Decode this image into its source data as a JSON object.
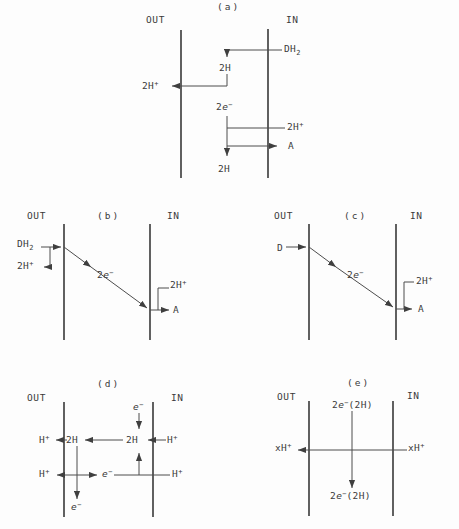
{
  "figure": {
    "background_color": "#fdfdfd",
    "ink_color": "#3a3a3a",
    "panels": {
      "a": {
        "title": "(a)",
        "out_label": "OUT",
        "in_label": "IN",
        "dh2": {
          "base": "DH",
          "sub": "2"
        },
        "h2_top": "2H",
        "h2plus_out": {
          "base": "2H",
          "sup": "+"
        },
        "two_e": {
          "coef": "2",
          "e": "e",
          "sup": "−"
        },
        "h2plus_in": {
          "base": "2H",
          "sup": "+"
        },
        "acceptor": "A",
        "h2_bottom": "2H"
      },
      "b": {
        "title": "(b)",
        "out_label": "OUT",
        "in_label": "IN",
        "dh2": {
          "base": "DH",
          "sub": "2"
        },
        "h2plus_out": {
          "base": "2H",
          "sup": "+"
        },
        "two_e": {
          "coef": "2",
          "e": "e",
          "sup": "−"
        },
        "h2plus_in": {
          "base": "2H",
          "sup": "+"
        },
        "acceptor": "A"
      },
      "c": {
        "title": "(c)",
        "out_label": "OUT",
        "in_label": "IN",
        "donor": "D",
        "two_e": {
          "coef": "2",
          "e": "e",
          "sup": "−"
        },
        "h2plus_in": {
          "base": "2H",
          "sup": "+"
        },
        "acceptor": "A"
      },
      "d": {
        "title": "(d)",
        "out_label": "OUT",
        "in_label": "IN",
        "e_top": {
          "e": "e",
          "sup": "−"
        },
        "h_out_top": {
          "base": "H",
          "sup": "+"
        },
        "h2_left": "2H",
        "h2_right": "2H",
        "h_in_top": {
          "base": "H",
          "sup": "+"
        },
        "h_out_bottom": {
          "base": "H",
          "sup": "+"
        },
        "e_mid": {
          "e": "e",
          "sup": "−"
        },
        "h_in_bottom": {
          "base": "H",
          "sup": "+"
        },
        "e_bottom": {
          "e": "e",
          "sup": "−"
        }
      },
      "e": {
        "title": "(e)",
        "out_label": "OUT",
        "in_label": "IN",
        "e_top": {
          "coef": "2",
          "e": "e",
          "sup": "−",
          "post": "(2H)"
        },
        "xh_out": {
          "base": "xH",
          "sup": "+"
        },
        "xh_in": {
          "base": "xH",
          "sup": "+"
        },
        "e_bottom": {
          "coef": "2",
          "e": "e",
          "sup": "−",
          "post": "(2H)"
        }
      }
    }
  }
}
